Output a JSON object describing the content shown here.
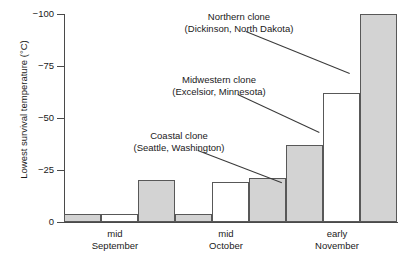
{
  "chart_data": {
    "type": "bar",
    "title": "",
    "subtitle": "",
    "xlabel": "",
    "ylabel": "Lowest survival temperature (°C)",
    "categories": [
      "mid September",
      "mid October",
      "early November"
    ],
    "category_lines": [
      [
        "mid",
        "September"
      ],
      [
        "mid",
        "October"
      ],
      [
        "early",
        "November"
      ]
    ],
    "ylim": [
      0,
      -100
    ],
    "y_inverted": true,
    "yticks": [
      0,
      -25,
      -50,
      -75,
      -100
    ],
    "ytick_labels": [
      "0",
      "−25",
      "−50",
      "−75",
      "−100"
    ],
    "grid": false,
    "legend_position": "annotations",
    "series": [
      {
        "name": "Coastal clone",
        "location": "Seattle, Washington",
        "fill": "gray",
        "color": "#d3d3d3",
        "values": [
          -4,
          -4,
          -37
        ]
      },
      {
        "name": "Midwestern clone",
        "location": "Excelsior, Minnesota",
        "fill": "white",
        "color": "#ffffff",
        "values": [
          -4,
          -19,
          -62
        ]
      },
      {
        "name": "Northern clone",
        "location": "Dickinson, North Dakota",
        "fill": "gray",
        "color": "#d3d3d3",
        "values": [
          -20,
          -21,
          -100
        ]
      }
    ],
    "annotations": [
      {
        "id": "northern",
        "line1": "Northern clone",
        "line2": "(Dickinson, North Dakota)"
      },
      {
        "id": "midwestern",
        "line1": "Midwestern clone",
        "line2": "(Excelsior, Minnesota)"
      },
      {
        "id": "coastal",
        "line1": "Coastal clone",
        "line2": "(Seattle, Washington)"
      }
    ]
  },
  "colors": {
    "bar_gray": "#d3d3d3",
    "bar_white": "#ffffff",
    "bar_edge": "#585858",
    "axis": "#4a4a4a",
    "text": "#1a1a1a",
    "leader": "#3a3a3a"
  }
}
